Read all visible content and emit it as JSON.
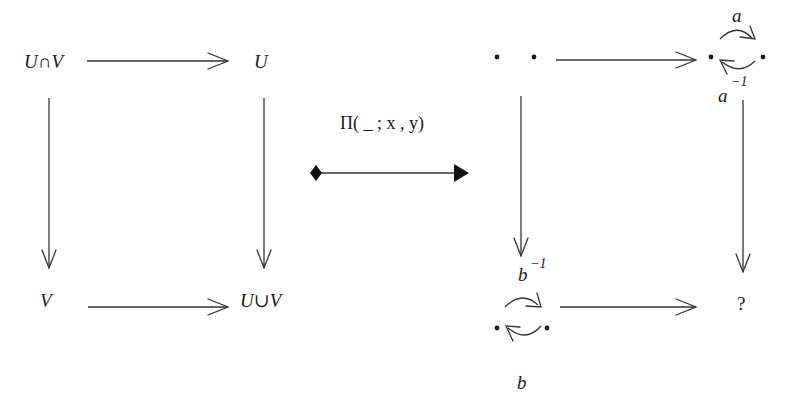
{
  "left_square": {
    "top_left": "U∩V",
    "top_right": "U",
    "bottom_left": "V",
    "bottom_right": "U∪V"
  },
  "functor": {
    "label": "Π( _ ; x , y)"
  },
  "right_square": {
    "top_right_loop_top": "a",
    "top_right_loop_bottom_base": "a",
    "top_right_loop_bottom_sup": "−1",
    "bottom_left_loop_top_base": "b",
    "bottom_left_loop_top_sup": "−1",
    "bottom_left_loop_bottom": "b",
    "bottom_right": "?"
  }
}
